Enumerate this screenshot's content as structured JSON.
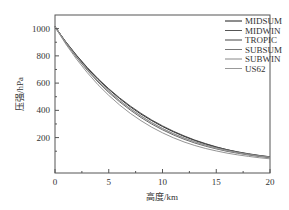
{
  "chart_data": {
    "type": "line",
    "title": "",
    "xlabel": "高度/km",
    "ylabel": "压强/hPa",
    "xlim": [
      0,
      20
    ],
    "ylim": [
      -60,
      1100
    ],
    "xticks": [
      0,
      5,
      10,
      15,
      20
    ],
    "yticks": [
      200,
      400,
      600,
      800,
      1000
    ],
    "grid": false,
    "legend_position": "upper right",
    "x": [
      0,
      1,
      2,
      3,
      4,
      5,
      6,
      7,
      8,
      9,
      10,
      11,
      12,
      13,
      14,
      15,
      16,
      17,
      18,
      19,
      20
    ],
    "series": [
      {
        "name": "MIDSUM",
        "color": "#1a1a1a",
        "values": [
          1013,
          902,
          802,
          710,
          628,
          554,
          487,
          426,
          372,
          324,
          281,
          243,
          209,
          179,
          153,
          130,
          111,
          95,
          81,
          69,
          59
        ]
      },
      {
        "name": "MIDWIN",
        "color": "#555555",
        "values": [
          1018,
          897,
          790,
          694,
          608,
          531,
          463,
          402,
          347,
          299,
          257,
          220,
          188,
          160,
          137,
          117,
          99,
          85,
          72,
          61,
          52
        ]
      },
      {
        "name": "TROPIC",
        "color": "#444444",
        "values": [
          1013,
          904,
          805,
          715,
          633,
          559,
          492,
          432,
          378,
          329,
          286,
          247,
          213,
          182,
          156,
          132,
          111,
          93,
          78,
          66,
          56
        ]
      },
      {
        "name": "SUBSUM",
        "color": "#777777",
        "values": [
          1010,
          896,
          792,
          700,
          616,
          541,
          473,
          413,
          359,
          310,
          267,
          230,
          198,
          170,
          146,
          125,
          108,
          92,
          79,
          68,
          58
        ]
      },
      {
        "name": "SUBWIN",
        "color": "#888888",
        "values": [
          1013,
          887,
          776,
          677,
          588,
          510,
          440,
          378,
          324,
          276,
          235,
          199,
          168,
          142,
          120,
          102,
          86,
          73,
          62,
          52,
          44
        ]
      },
      {
        "name": "US62",
        "color": "#999999",
        "values": [
          1013,
          899,
          795,
          701,
          616,
          540,
          472,
          411,
          357,
          308,
          265,
          227,
          194,
          166,
          142,
          121,
          103,
          88,
          75,
          64,
          55
        ]
      }
    ]
  }
}
